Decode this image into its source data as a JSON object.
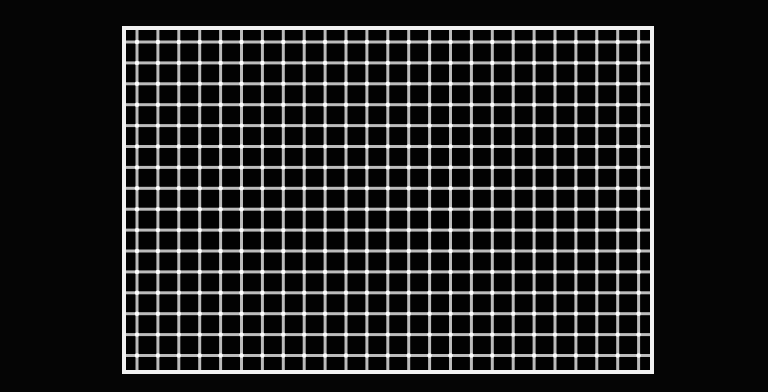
{
  "scene": {
    "description": "Hermann grid illusion: white frame enclosing a black field with a regular lattice of light gray lines",
    "background_color": "#050505",
    "frame": {
      "border_color": "#f2f2f2",
      "fill_color": "#020202",
      "x": 122,
      "y": 26,
      "width": 532,
      "height": 348,
      "border_width": 4
    },
    "grid": {
      "line_color": "#bcbcbc",
      "intersection_color": "#ffffff",
      "line_width": 3,
      "pitch": 20.9,
      "first_vertical_offset": 11,
      "first_horizontal_offset": 12,
      "columns": 25,
      "rows": 16
    }
  }
}
